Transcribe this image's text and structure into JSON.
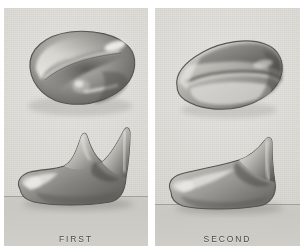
{
  "plate": {
    "background_color": "#ffffff",
    "panel_color": "#dcdbd6",
    "panel_count": 2
  },
  "panels": [
    {
      "id": "first",
      "label": "FIRST",
      "specimens": [
        {
          "view": "occlusal-view",
          "name": "tooth-crown-occlusal"
        },
        {
          "view": "lateral-view",
          "name": "tooth-crown-lateral-two-cusps"
        }
      ]
    },
    {
      "id": "second",
      "label": "SECOND",
      "specimens": [
        {
          "view": "occlusal-view",
          "name": "tooth-crown-occlusal"
        },
        {
          "view": "lateral-view",
          "name": "tooth-crown-lateral-single-cusp"
        }
      ]
    }
  ],
  "colors": {
    "panel_paper": "#dcdbd6",
    "shelf": "#c8c7c2",
    "label_text": "#4b4b49",
    "specimen_dark": "#5d5c58",
    "specimen_mid": "#9a9994",
    "specimen_light": "#e8e7e3"
  }
}
